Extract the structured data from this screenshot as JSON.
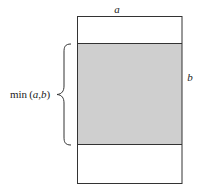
{
  "diagram": {
    "labels": {
      "top": "a",
      "right": "b",
      "brace_prefix": "min",
      "brace_open": "(",
      "brace_a": "a",
      "brace_comma": ",",
      "brace_b": "b",
      "brace_close": ")"
    },
    "colors": {
      "stroke": "#333333",
      "fill_shaded": "#cfcfcf",
      "background": "#ffffff"
    }
  }
}
